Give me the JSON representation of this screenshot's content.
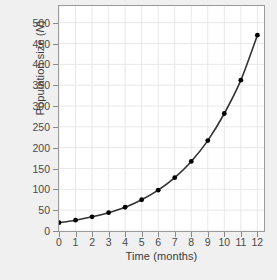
{
  "chart_data": {
    "type": "line",
    "title": "",
    "xlabel": "Time (months)",
    "ylabel_prefix": "Population size (",
    "ylabel_var": "N",
    "ylabel_suffix": ")",
    "x": [
      0,
      1,
      2,
      3,
      4,
      5,
      6,
      7,
      8,
      9,
      10,
      11,
      12
    ],
    "values": [
      20,
      26,
      34,
      44,
      57,
      75,
      98,
      128,
      167,
      217,
      282,
      362,
      470
    ],
    "xtick_labels": [
      "0",
      "1",
      "2",
      "3",
      "4",
      "5",
      "6",
      "7",
      "8",
      "9",
      "10",
      "11",
      "12"
    ],
    "ytick_labels": [
      "0",
      "50",
      "100",
      "150",
      "200",
      "250",
      "300",
      "350",
      "400",
      "450",
      "500"
    ],
    "ytick_values": [
      0,
      50,
      100,
      150,
      200,
      250,
      300,
      350,
      400,
      450,
      500
    ],
    "xlim": [
      0,
      12.4
    ],
    "ylim": [
      0,
      540
    ],
    "grid": true,
    "legend": "none",
    "marker": "filled-circle",
    "line_color": "#333333",
    "marker_color": "#000000",
    "grid_color": "#e8e8e8",
    "plot_background": "#ffffff",
    "figure_background": "#f0f0f0"
  }
}
